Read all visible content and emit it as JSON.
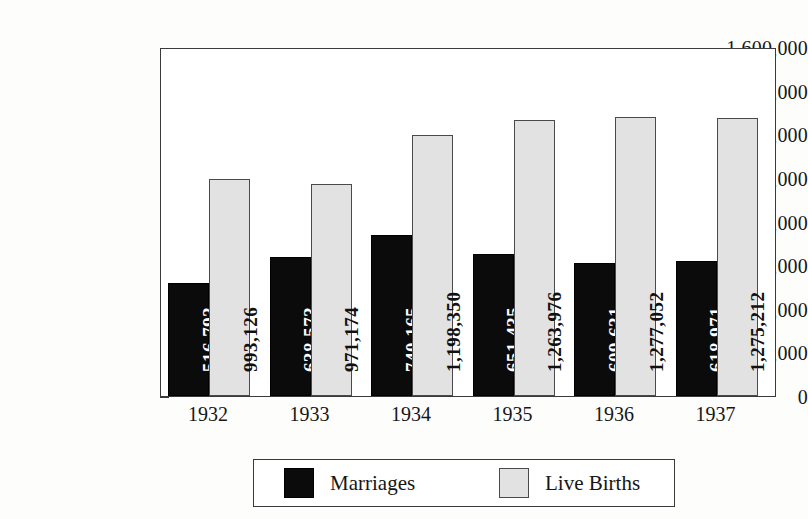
{
  "chart_data": {
    "type": "bar",
    "title": "",
    "subtitle": "",
    "xlabel": "",
    "ylabel": "",
    "categories": [
      "1932",
      "1933",
      "1934",
      "1935",
      "1936",
      "1937"
    ],
    "ylim": [
      0,
      1600000
    ],
    "y_tick_interval": 200000,
    "y_minor_tick_interval": 100000,
    "grid": false,
    "legend_position": "bottom",
    "y_tick_labels": [
      "1,600,000",
      "1,400,000",
      "1,200,000",
      "1,000,000",
      "800,000",
      "600,000",
      "400,000",
      "200,000",
      "0"
    ],
    "y_tick_values": [
      1600000,
      1400000,
      1200000,
      1000000,
      800000,
      600000,
      400000,
      200000,
      0
    ],
    "series": [
      {
        "name": "Marriages",
        "color": "#0b0b0b",
        "values": [
          516793,
          638573,
          740165,
          651435,
          609631,
          618971
        ],
        "value_labels": [
          "516,793",
          "638,573",
          "740,165",
          "651,435",
          "609,631",
          "618,971"
        ]
      },
      {
        "name": "Live Births",
        "color": "#e2e2e2",
        "values": [
          993126,
          971174,
          1198350,
          1263976,
          1277052,
          1275212
        ],
        "value_labels": [
          "993,126",
          "971,174",
          "1,198,350",
          "1,263,976",
          "1,277,052",
          "1,275,212"
        ]
      }
    ]
  },
  "legend": {
    "entries": [
      {
        "label": "Marriages",
        "swatch": "dark"
      },
      {
        "label": "Live Births",
        "swatch": "light"
      }
    ]
  }
}
